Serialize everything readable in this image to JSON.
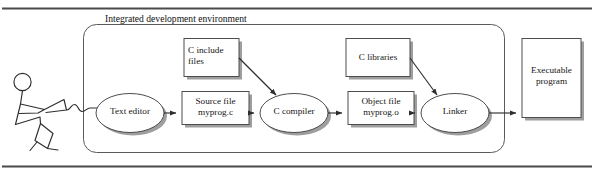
{
  "figure": {
    "title": "Integrated development environment",
    "ink_color": "#3c3c3c",
    "shadow_color": "#9a9a9a",
    "rule_color": "#4a4a4a",
    "text_color": "#161616",
    "background": "#ffffff"
  },
  "actor": {
    "name": "programmer-stick-figure",
    "label": ""
  },
  "nodes": {
    "text_editor": {
      "label": "Text editor",
      "shape": "ellipse"
    },
    "source_file": {
      "label": "Source file\nmyprog.c",
      "shape": "rect"
    },
    "c_compiler": {
      "label": "C compiler",
      "shape": "ellipse"
    },
    "object_file": {
      "label": "Object file\nmyprog.o",
      "shape": "rect"
    },
    "linker": {
      "label": "Linker",
      "shape": "ellipse"
    },
    "c_include_files": {
      "label": "C include\nfiles",
      "shape": "rect"
    },
    "c_libraries": {
      "label": "C libraries",
      "shape": "rect"
    },
    "executable_program": {
      "label": "Executable\nprogram",
      "shape": "rect"
    }
  },
  "edges": [
    {
      "from": "programmer",
      "to": "text_editor",
      "style": "squiggle"
    },
    {
      "from": "text_editor",
      "to": "source_file",
      "style": "arrow"
    },
    {
      "from": "source_file",
      "to": "c_compiler",
      "style": "arrow"
    },
    {
      "from": "c_include_files",
      "to": "c_compiler",
      "style": "diagonal-arrow"
    },
    {
      "from": "c_compiler",
      "to": "object_file",
      "style": "arrow"
    },
    {
      "from": "object_file",
      "to": "linker",
      "style": "arrow"
    },
    {
      "from": "c_libraries",
      "to": "linker",
      "style": "diagonal-arrow"
    },
    {
      "from": "linker",
      "to": "executable_program",
      "style": "arrow"
    }
  ]
}
